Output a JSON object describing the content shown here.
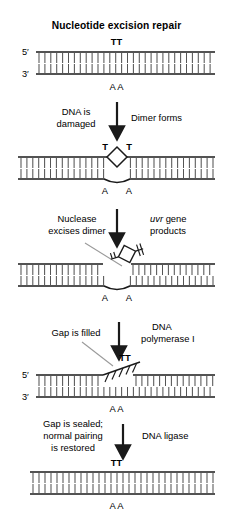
{
  "figure": {
    "title": "Nucleotide excision repair",
    "background": "#ffffff",
    "ink": "#1a1a1a",
    "leader_color": "#9a9a9a",
    "rung_color": "#555555"
  },
  "labels": {
    "five_prime": "5′",
    "three_prime": "3′",
    "thymine_pair": "TT",
    "thymine_left": "T",
    "thymine_right": "T",
    "adenine_left": "A",
    "adenine_right": "A"
  },
  "steps": [
    {
      "id": "step-1-normal-dna",
      "left_caption": "",
      "right_caption": "",
      "top_bases": "TT",
      "bottom_bases": "A A",
      "five_prime": "5′",
      "three_prime": "3′"
    },
    {
      "id": "step-2-dimer",
      "left_caption_line1": "DNA is",
      "left_caption_line2": "damaged",
      "right_caption_line1": "Dimer forms",
      "right_caption_line2": "",
      "top_bases_left": "T",
      "top_bases_right": "T",
      "bottom_bases": "A A"
    },
    {
      "id": "step-3-excision",
      "left_caption_line1": "Nuclease",
      "left_caption_line2": "excises dimer",
      "right_caption_line1": "uvr",
      "right_caption_line1_rest": " gene",
      "right_caption_line2": "products",
      "bottom_bases": "A A"
    },
    {
      "id": "step-4-gap-filled",
      "left_caption_line1": "Gap is filled",
      "right_caption_line1": "DNA",
      "right_caption_line2": "polymerase I",
      "top_bases": "TT",
      "bottom_bases": "A A",
      "five_prime": "5′",
      "three_prime": "3′"
    },
    {
      "id": "step-5-sealed",
      "left_caption_line1": "Gap is sealed;",
      "left_caption_line2": "normal pairing",
      "left_caption_line3": "is restored",
      "right_caption_line1": "DNA ligase",
      "top_bases": "TT",
      "bottom_bases": "A A"
    }
  ]
}
